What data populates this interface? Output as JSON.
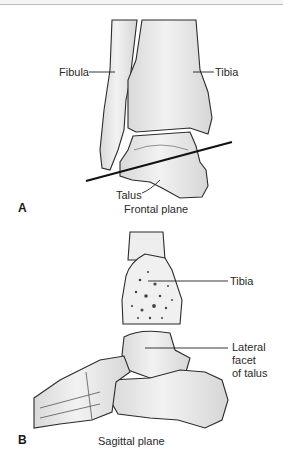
{
  "figure": {
    "panel_a": {
      "letter": "A",
      "caption": "Frontal plane",
      "labels": {
        "fibula": "Fibula",
        "tibia": "Tibia",
        "talus": "Talus"
      }
    },
    "panel_b": {
      "letter": "B",
      "caption": "Sagittal plane",
      "labels": {
        "tibia": "Tibia",
        "lateral_facet_line1": "Lateral",
        "lateral_facet_line2": "facet",
        "lateral_facet_line3": "of talus"
      }
    },
    "colors": {
      "bone_fill": "#ececec",
      "outline": "#2b2b2b",
      "plane_line": "#111111",
      "background": "#ffffff"
    }
  }
}
